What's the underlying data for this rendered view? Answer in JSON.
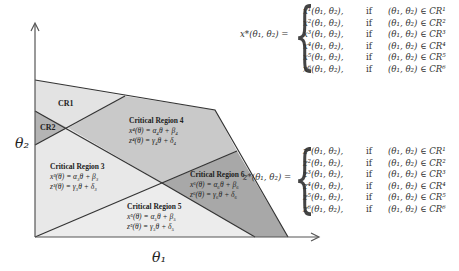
{
  "axes": {
    "x_label": "θ₁",
    "y_label": "θ₂"
  },
  "colors": {
    "light_region": "#e6e6e6",
    "mid_region": "#c8c8c8",
    "dark_region": "#a9a9a9",
    "edge": "#333333"
  },
  "regions": [
    {
      "id": "CR1",
      "label": "CR1"
    },
    {
      "id": "CR2",
      "label": "CR2"
    },
    {
      "id": "CR3",
      "title": "Critical Region 3",
      "x_eq": "x³(θ) = α₃θ + β₃",
      "z_eq": "z³(θ) = γ₃θ + δ₃"
    },
    {
      "id": "CR4",
      "title": "Critical Region 4",
      "x_eq": "x⁴(θ) = α₄θ + β₄",
      "z_eq": "z⁴(θ) = γ₄θ + δ₄"
    },
    {
      "id": "CR5",
      "title": "Critical Region 5",
      "x_eq": "x⁵(θ) = α₅θ + β₅",
      "z_eq": "z⁵(θ) = γ₅θ + δ₅"
    },
    {
      "id": "CR6",
      "title": "Critical Region 6",
      "x_eq": "x⁶(θ) = α₆θ + β₆",
      "z_eq": "z⁶(θ) = γ₆θ + δ₆"
    }
  ],
  "x_piecewise": {
    "lhs": "x*(θ₁, θ₂) =",
    "rows": [
      {
        "f": "x¹(θ₁, θ₂),",
        "cond": "if",
        "set": "(θ₁, θ₂) ∈ CR¹"
      },
      {
        "f": "x²(θ₁, θ₂),",
        "cond": "if",
        "set": "(θ₁, θ₂) ∈ CR²"
      },
      {
        "f": "x³(θ₁, θ₂),",
        "cond": "if",
        "set": "(θ₁, θ₂) ∈ CR³"
      },
      {
        "f": "x⁴(θ₁, θ₂),",
        "cond": "if",
        "set": "(θ₁, θ₂) ∈ CR⁴"
      },
      {
        "f": "x⁵(θ₁, θ₂),",
        "cond": "if",
        "set": "(θ₁, θ₂) ∈ CR⁵"
      },
      {
        "f": "x⁶(θ₁, θ₂),",
        "cond": "if",
        "set": "(θ₁, θ₂) ∈ CR⁶"
      }
    ]
  },
  "z_piecewise": {
    "lhs": "z*(θ₁, θ₂) =",
    "rows": [
      {
        "f": "z¹(θ₁, θ₂),",
        "cond": "if",
        "set": "(θ₁, θ₂) ∈ CR¹"
      },
      {
        "f": "z²(θ₁, θ₂),",
        "cond": "if",
        "set": "(θ₁, θ₂) ∈ CR²"
      },
      {
        "f": "z³(θ₁, θ₂),",
        "cond": "if",
        "set": "(θ₁, θ₂) ∈ CR³"
      },
      {
        "f": "z⁴(θ₁, θ₂),",
        "cond": "if",
        "set": "(θ₁, θ₂) ∈ CR⁴"
      },
      {
        "f": "z⁵(θ₁, θ₂),",
        "cond": "if",
        "set": "(θ₁, θ₂) ∈ CR⁵"
      },
      {
        "f": "z⁶(θ₁, θ₂),",
        "cond": "if",
        "set": "(θ₁, θ₂) ∈ CR⁶"
      }
    ]
  }
}
